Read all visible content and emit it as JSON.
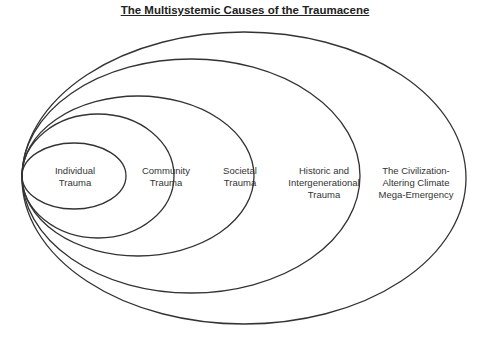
{
  "title": "The Multisystemic Causes of the Traumacene",
  "levels": [
    {
      "label": "Individual Trauma",
      "lines": [
        "Individual",
        "Trauma"
      ]
    },
    {
      "label": "Community Trauma",
      "lines": [
        "Community",
        "Trauma"
      ]
    },
    {
      "label": "Societal Trauma",
      "lines": [
        "Societal",
        "Trauma"
      ]
    },
    {
      "label": "Historic and Intergenerational Trauma",
      "lines": [
        "Historic and",
        "Intergenerational",
        "Trauma"
      ]
    },
    {
      "label": "The Civilization-Altering Climate Mega-Emergency",
      "lines": [
        "The Civilization-",
        "Altering Climate",
        "Mega-Emergency"
      ]
    }
  ],
  "colors": {
    "stroke": "#333333",
    "text": "#333333",
    "background": "#ffffff"
  }
}
